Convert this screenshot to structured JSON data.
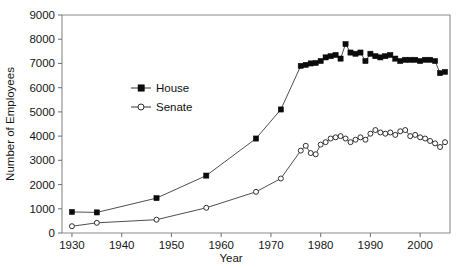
{
  "chart_data": {
    "type": "line",
    "title": "",
    "xlabel": "Year",
    "ylabel": "Number of Employees",
    "xlim": [
      1928,
      2006
    ],
    "ylim": [
      0,
      9000
    ],
    "grid": false,
    "legend_position": "inside-upper-left",
    "xticks": [
      1930,
      1940,
      1950,
      1960,
      1970,
      1980,
      1990,
      2000
    ],
    "xtick_labels": [
      "1930",
      "1940",
      "1950",
      "1960",
      "1970",
      "1980",
      "1990",
      "2000"
    ],
    "yticks": [
      0,
      1000,
      2000,
      3000,
      4000,
      5000,
      6000,
      7000,
      8000,
      9000
    ],
    "ytick_labels": [
      "0",
      "1000",
      "2000",
      "3000",
      "4000",
      "5000",
      "6000",
      "7000",
      "8000",
      "9000"
    ],
    "series": [
      {
        "name": "House",
        "marker": "filled-square",
        "x": [
          1930,
          1935,
          1947,
          1957,
          1967,
          1972,
          1976,
          1977,
          1978,
          1979,
          1980,
          1981,
          1982,
          1983,
          1984,
          1985,
          1986,
          1987,
          1988,
          1989,
          1990,
          1991,
          1992,
          1993,
          1994,
          1995,
          1996,
          1997,
          1998,
          1999,
          2000,
          2001,
          2002,
          2003,
          2004,
          2005
        ],
        "values": [
          870,
          850,
          1440,
          2370,
          3900,
          5100,
          6900,
          6942,
          7000,
          7020,
          7100,
          7250,
          7300,
          7350,
          7200,
          7800,
          7450,
          7400,
          7450,
          7100,
          7400,
          7300,
          7250,
          7300,
          7350,
          7200,
          7100,
          7150,
          7150,
          7150,
          7100,
          7150,
          7150,
          7100,
          6600,
          6650
        ]
      },
      {
        "name": "Senate",
        "marker": "open-circle",
        "x": [
          1930,
          1935,
          1947,
          1957,
          1967,
          1972,
          1976,
          1977,
          1978,
          1979,
          1980,
          1981,
          1982,
          1983,
          1984,
          1985,
          1986,
          1987,
          1988,
          1989,
          1990,
          1991,
          1992,
          1993,
          1994,
          1995,
          1996,
          1997,
          1998,
          1999,
          2000,
          2001,
          2002,
          2003,
          2004,
          2005
        ],
        "values": [
          280,
          420,
          550,
          1040,
          1700,
          2250,
          3400,
          3600,
          3300,
          3250,
          3650,
          3750,
          3900,
          3950,
          4000,
          3900,
          3750,
          3850,
          3950,
          3850,
          4100,
          4250,
          4150,
          4100,
          4150,
          4050,
          4200,
          4250,
          4000,
          4050,
          3950,
          3900,
          3800,
          3700,
          3550,
          3750
        ]
      }
    ],
    "legend": [
      {
        "label": "House",
        "marker": "filled-square"
      },
      {
        "label": "Senate",
        "marker": "open-circle"
      }
    ]
  },
  "layout": {
    "plot_left": 62,
    "plot_right": 450,
    "plot_top": 15,
    "plot_bottom": 233
  }
}
